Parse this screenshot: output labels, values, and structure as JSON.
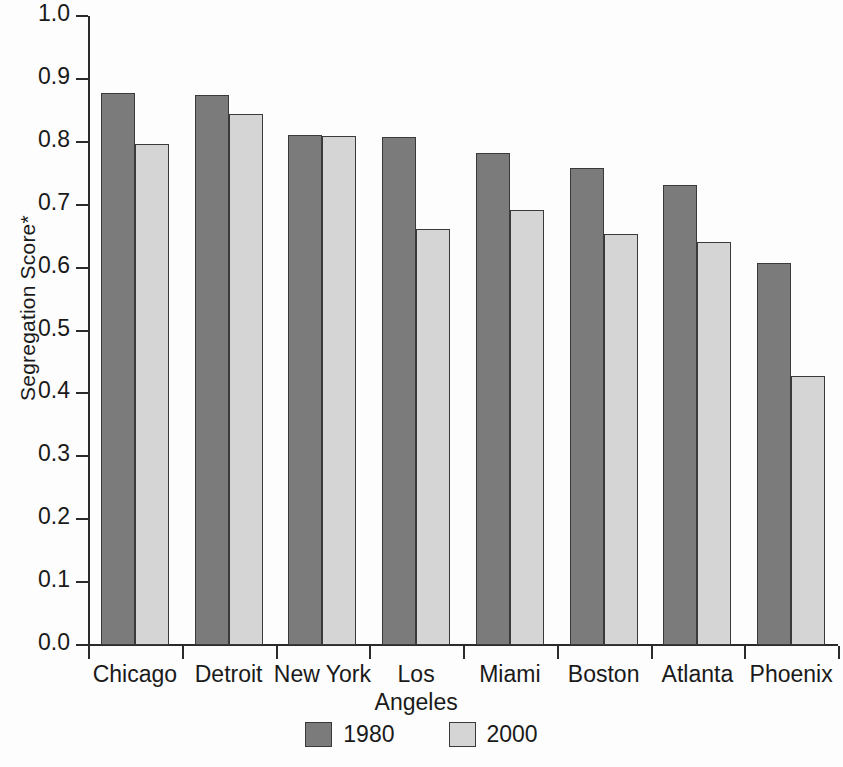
{
  "chart_data": {
    "type": "bar",
    "title": "",
    "xlabel": "",
    "ylabel": "Segregation Score*",
    "ylim": [
      0.0,
      1.0
    ],
    "ytick_labels": [
      "1.0",
      "0.9",
      "0.8",
      "0.7",
      "0.6",
      "0.5",
      "0.4",
      "0.3",
      "0.2",
      "0.1",
      "0.0"
    ],
    "ytick_values": [
      1.0,
      0.9,
      0.8,
      0.7,
      0.6,
      0.5,
      0.4,
      0.3,
      0.2,
      0.1,
      0.0
    ],
    "grid": false,
    "legend_position": "bottom-center",
    "categories": [
      "Chicago",
      "Detroit",
      "New York",
      "Los Angeles",
      "Miami",
      "Boston",
      "Atlanta",
      "Phoenix"
    ],
    "category_lines": [
      [
        "Chicago"
      ],
      [
        "Detroit"
      ],
      [
        "New York"
      ],
      [
        "Los",
        "Angeles"
      ],
      [
        "Miami"
      ],
      [
        "Boston"
      ],
      [
        "Atlanta"
      ],
      [
        "Phoenix"
      ]
    ],
    "series": [
      {
        "name": "1980",
        "color": "#7b7b7b",
        "values": [
          0.877,
          0.874,
          0.811,
          0.807,
          0.782,
          0.759,
          0.732,
          0.607
        ]
      },
      {
        "name": "2000",
        "color": "#d5d5d5",
        "values": [
          0.796,
          0.845,
          0.809,
          0.661,
          0.691,
          0.653,
          0.64,
          0.427
        ]
      }
    ],
    "annotations": [
      "* asterisk on y-axis label denotes footnote"
    ]
  },
  "legend": {
    "items": [
      {
        "label": "1980",
        "swatch": "dark-gray-swatch"
      },
      {
        "label": "2000",
        "swatch": "light-gray-swatch"
      }
    ]
  },
  "colors": {
    "series_1980": "#7b7b7b",
    "series_2000": "#d5d5d5",
    "axis": "#2b2b2b",
    "bar_border": "#3a3a3a",
    "background": "#fdfdfd",
    "text": "#1a1a1a"
  }
}
